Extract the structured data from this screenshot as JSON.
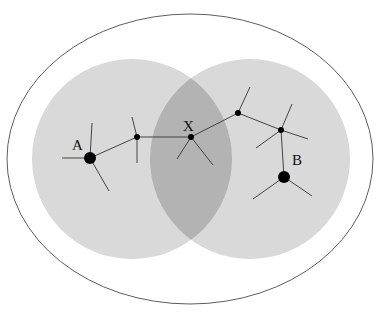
{
  "diagram": {
    "colors": {
      "outline": "#333333",
      "region": "#d9d9d9",
      "overlap": "#b3b3b3",
      "node": "#000000",
      "edge": "#444444"
    },
    "outer_ellipse": {
      "cx": 190,
      "cy": 159,
      "rx": 183,
      "ry": 145
    },
    "regions": [
      {
        "id": "left",
        "cx": 132,
        "cy": 159,
        "r": 100
      },
      {
        "id": "right",
        "cx": 250,
        "cy": 159,
        "r": 100
      }
    ],
    "nodes": [
      {
        "id": "A",
        "x": 90,
        "y": 158,
        "r": 6,
        "label": "A",
        "lx": 72,
        "ly": 150
      },
      {
        "id": "n1",
        "x": 137,
        "y": 137,
        "r": 3
      },
      {
        "id": "X",
        "x": 191,
        "y": 137,
        "r": 3,
        "label": "X",
        "lx": 183,
        "ly": 131
      },
      {
        "id": "n2",
        "x": 238,
        "y": 113,
        "r": 3
      },
      {
        "id": "n3",
        "x": 281,
        "y": 130,
        "r": 3
      },
      {
        "id": "B",
        "x": 284,
        "y": 177,
        "r": 6,
        "label": "B",
        "lx": 292,
        "ly": 165
      }
    ],
    "edges": [
      [
        90,
        158,
        137,
        137
      ],
      [
        137,
        137,
        191,
        137
      ],
      [
        191,
        137,
        238,
        113
      ],
      [
        238,
        113,
        281,
        130
      ],
      [
        281,
        130,
        284,
        177
      ],
      [
        90,
        158,
        62,
        158
      ],
      [
        90,
        158,
        92,
        123
      ],
      [
        90,
        158,
        109,
        191
      ],
      [
        137,
        137,
        132,
        117
      ],
      [
        137,
        137,
        137,
        163
      ],
      [
        191,
        137,
        177,
        159
      ],
      [
        191,
        137,
        213,
        165
      ],
      [
        238,
        113,
        250,
        87
      ],
      [
        281,
        130,
        292,
        104
      ],
      [
        281,
        130,
        308,
        139
      ],
      [
        281,
        130,
        256,
        148
      ],
      [
        284,
        177,
        253,
        199
      ],
      [
        284,
        177,
        312,
        196
      ]
    ],
    "labels": {
      "a": "A",
      "x": "X",
      "b": "B"
    }
  }
}
